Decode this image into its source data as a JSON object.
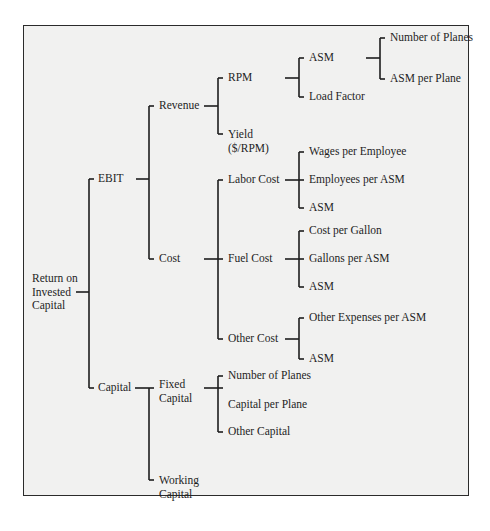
{
  "diagram": {
    "type": "tree",
    "orientation": "left-to-right",
    "root": {
      "label": "Return on Invested Capital",
      "lines": [
        "Return on",
        "Invested",
        "Capital"
      ]
    },
    "nodes": {
      "ebit": "EBIT",
      "capital": "Capital",
      "revenue": "Revenue",
      "cost": "Cost",
      "rpm": "RPM",
      "yield_1": "Yield",
      "yield_2": "($/RPM)",
      "asm_rpm": "ASM",
      "load_factor": "Load Factor",
      "number_of_planes_asm": "Number of Planes",
      "asm_per_plane": "ASM per Plane",
      "labor_cost": "Labor Cost",
      "fuel_cost": "Fuel Cost",
      "other_cost": "Other Cost",
      "wages_per_employee": "Wages per Employee",
      "employees_per_asm": "Employees per ASM",
      "asm_labor": "ASM",
      "cost_per_gallon": "Cost per Gallon",
      "gallons_per_asm": "Gallons per ASM",
      "asm_fuel": "ASM",
      "other_expenses_per_asm": "Other Expenses per ASM",
      "asm_other": "ASM",
      "fixed_capital_1": "Fixed",
      "fixed_capital_2": "Capital",
      "working_capital_1": "Working",
      "working_capital_2": "Capital",
      "number_of_planes_cap": "Number of Planes",
      "capital_per_plane": "Capital per Plane",
      "other_capital": "Other Capital"
    },
    "structure": {
      "Return on Invested Capital": [
        "EBIT",
        "Capital"
      ],
      "EBIT": [
        "Revenue",
        "Cost"
      ],
      "Revenue": [
        "RPM",
        "Yield ($/RPM)"
      ],
      "RPM": [
        "ASM",
        "Load Factor"
      ],
      "ASM": [
        "Number of Planes",
        "ASM per Plane"
      ],
      "Cost": [
        "Labor Cost",
        "Fuel Cost",
        "Other Cost"
      ],
      "Labor Cost": [
        "Wages per Employee",
        "Employees per ASM",
        "ASM"
      ],
      "Fuel Cost": [
        "Cost per Gallon",
        "Gallons per ASM",
        "ASM"
      ],
      "Other Cost": [
        "Other Expenses per ASM",
        "ASM"
      ],
      "Capital": [
        "Fixed Capital",
        "Working Capital"
      ],
      "Fixed Capital": [
        "Number of Planes",
        "Capital per Plane",
        "Other Capital"
      ]
    },
    "colors": {
      "line": "#1e1e1e",
      "background": "#f1f1f0",
      "border": "#2b2b2b"
    }
  }
}
